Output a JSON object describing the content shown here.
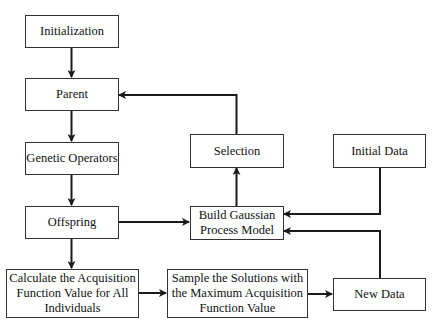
{
  "diagram": {
    "type": "flowchart",
    "nodes": {
      "initialization": "Initialization",
      "parent": "Parent",
      "genetic_operators": "Genetic Operators",
      "offspring": "Offspring",
      "calculate": "Calculate the Acquisition\nFunction Value for All\nIndividuals",
      "selection": "Selection",
      "build_gp": "Build Gaussian\nProcess Model",
      "initial_data": "Initial Data",
      "sample": "Sample the Solutions with\nthe Maximum Acquisition\nFunction Value",
      "new_data": "New Data"
    },
    "edges": [
      {
        "from": "Initialization",
        "to": "Parent"
      },
      {
        "from": "Parent",
        "to": "Genetic Operators"
      },
      {
        "from": "Genetic Operators",
        "to": "Offspring"
      },
      {
        "from": "Offspring",
        "to": "Calculate the Acquisition Function Value for All Individuals"
      },
      {
        "from": "Offspring",
        "to": "Build Gaussian Process Model"
      },
      {
        "from": "Calculate the Acquisition Function Value for All Individuals",
        "to": "Sample the Solutions with the Maximum Acquisition Function Value"
      },
      {
        "from": "Sample the Solutions with the Maximum Acquisition Function Value",
        "to": "New Data"
      },
      {
        "from": "New Data",
        "to": "Build Gaussian Process Model"
      },
      {
        "from": "Initial Data",
        "to": "Build Gaussian Process Model"
      },
      {
        "from": "Build Gaussian Process Model",
        "to": "Selection"
      },
      {
        "from": "Selection",
        "to": "Parent"
      }
    ],
    "colors": {
      "line": "#1a1a1a",
      "border": "#333333",
      "background": "#ffffff"
    }
  }
}
